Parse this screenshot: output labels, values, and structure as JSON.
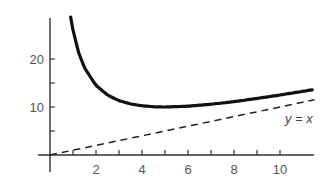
{
  "chart_data": {
    "type": "line",
    "title": "",
    "xlabel": "",
    "ylabel": "",
    "xlim": [
      0,
      11.5
    ],
    "ylim": [
      0,
      29
    ],
    "grid": false,
    "legend": null,
    "x_ticks": [
      1,
      2,
      3,
      4,
      5,
      6,
      7,
      8,
      9,
      10
    ],
    "x_tick_labels": [
      "2",
      "4",
      "6",
      "8",
      "10"
    ],
    "x_tick_label_values": [
      2,
      4,
      6,
      8,
      10
    ],
    "y_ticks": [
      5,
      10,
      15,
      20
    ],
    "y_tick_labels": [
      "10",
      "20"
    ],
    "y_tick_label_values": [
      10,
      20
    ],
    "series": [
      {
        "name": "curve",
        "style": "solid",
        "description": "y = x + 25/x",
        "x": [
          0.9,
          1,
          1.25,
          1.5,
          2,
          2.5,
          3,
          3.5,
          4,
          4.5,
          5,
          6,
          7,
          8,
          9,
          10,
          11,
          11.4
        ],
        "y": [
          28.7,
          26.0,
          21.25,
          18.17,
          14.5,
          12.5,
          11.33,
          10.64,
          10.25,
          10.06,
          10.0,
          10.17,
          10.57,
          11.13,
          11.78,
          12.5,
          13.27,
          13.59
        ]
      },
      {
        "name": "y = x",
        "style": "dashed",
        "x": [
          0,
          11.5
        ],
        "y": [
          0,
          11.5
        ]
      }
    ],
    "annotations": [
      {
        "text": "y = x",
        "x": 10.3,
        "y": 8.0
      }
    ]
  },
  "labels": {
    "annotation": "y = x"
  }
}
